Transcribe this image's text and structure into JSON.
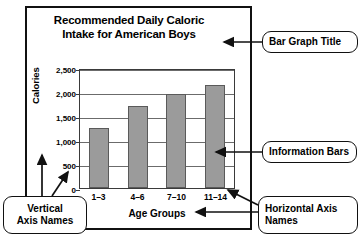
{
  "chart_data": {
    "type": "bar",
    "title": "Recommended Daily Caloric Intake for American Boys",
    "title_lines": [
      "Recommended Daily Caloric",
      "Intake for American Boys"
    ],
    "categories": [
      "1–3",
      "4–6",
      "7–10",
      "11–14"
    ],
    "values": [
      1250,
      1700,
      1950,
      2150
    ],
    "xlabel": "Age Groups",
    "ylabel": "Calories",
    "ylim": [
      0,
      2500
    ],
    "ytick_values": [
      0,
      500,
      1000,
      1500,
      2000,
      2500
    ],
    "ytick_labels": [
      "0",
      "500",
      "1,000",
      "1,500",
      "2,000",
      "2,500"
    ],
    "grid": "horizontal",
    "legend": "none",
    "bar_color": "#9b9b9b",
    "bar_border_color": "#5a5a5a"
  },
  "annotations": {
    "title_callout": {
      "label": "Bar Graph Title"
    },
    "bars_callout": {
      "label": "Information Bars"
    },
    "horizontal_axis_callout": {
      "lines": [
        "Horizontal Axis",
        "Names"
      ]
    },
    "vertical_axis_callout": {
      "lines": [
        "Vertical",
        "Axis Names"
      ]
    }
  },
  "colors": {
    "frame": "#111111",
    "bar_fill": "#9b9b9b",
    "bar_stroke": "#5a5a5a",
    "gridline": "#6b6b6b",
    "text": "#000000"
  }
}
